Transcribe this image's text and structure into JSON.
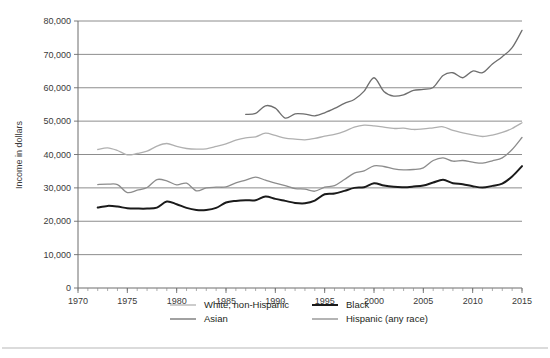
{
  "chart_data": {
    "type": "line",
    "title": "",
    "subtitle": "",
    "xlabel": "",
    "ylabel": "Income in dollars",
    "xlim": [
      1970,
      2015
    ],
    "ylim": [
      0,
      80000
    ],
    "grid": true,
    "legend_position": "bottom",
    "y_ticks": [
      0,
      10000,
      20000,
      30000,
      40000,
      50000,
      60000,
      70000,
      80000
    ],
    "y_tick_labels": [
      "0",
      "10,000",
      "20,000",
      "30,000",
      "40,000",
      "50,000",
      "60,000",
      "70,000",
      "80,000"
    ],
    "x_ticks": [
      1970,
      1975,
      1980,
      1985,
      1990,
      1995,
      2000,
      2005,
      2010,
      2015
    ],
    "x_tick_labels": [
      "1970",
      "1975",
      "1980",
      "1985",
      "1990",
      "1995",
      "2000",
      "2005",
      "2010",
      "2015"
    ],
    "x_minor_tick_step": 1,
    "series": [
      {
        "name": "White, non-Hispanic",
        "color": "#b0b0b0",
        "width": 1.3,
        "x": [
          1972,
          1973,
          1974,
          1975,
          1976,
          1977,
          1978,
          1979,
          1980,
          1981,
          1982,
          1983,
          1984,
          1985,
          1986,
          1987,
          1988,
          1989,
          1990,
          1991,
          1992,
          1993,
          1994,
          1995,
          1996,
          1997,
          1998,
          1999,
          2000,
          2001,
          2002,
          2003,
          2004,
          2005,
          2006,
          2007,
          2008,
          2009,
          2010,
          2011,
          2012,
          2013,
          2014,
          2015
        ],
        "values": [
          41500,
          42000,
          41200,
          39900,
          40300,
          41000,
          42500,
          43300,
          42400,
          41800,
          41600,
          41700,
          42400,
          43200,
          44300,
          45000,
          45300,
          46400,
          45700,
          44900,
          44600,
          44400,
          44800,
          45500,
          46000,
          46900,
          48200,
          48800,
          48600,
          48200,
          47800,
          47900,
          47500,
          47700,
          48000,
          48300,
          47200,
          46500,
          45900,
          45400,
          45800,
          46600,
          47800,
          49500
        ],
        "gap_values_note": "continuous 1972-2015"
      },
      {
        "name": "Asian",
        "color": "#6e6e6e",
        "width": 1.3,
        "x": [
          1987,
          1988,
          1989,
          1990,
          1991,
          1992,
          1993,
          1994,
          1995,
          1996,
          1997,
          1998,
          1999,
          2000,
          2001,
          2002,
          2003,
          2004,
          2005,
          2006,
          2007,
          2008,
          2009,
          2010,
          2011,
          2012,
          2013,
          2014,
          2015
        ],
        "values": [
          52000,
          52300,
          54600,
          53900,
          50900,
          52200,
          52100,
          51600,
          52500,
          53800,
          55300,
          56500,
          59000,
          63000,
          58900,
          57500,
          57900,
          59200,
          59500,
          60100,
          63700,
          64500,
          63000,
          65000,
          64500,
          67100,
          69300,
          72000,
          77200
        ]
      },
      {
        "name": "Black",
        "color": "#1a1a1a",
        "width": 2.0,
        "x": [
          1972,
          1973,
          1974,
          1975,
          1976,
          1977,
          1978,
          1979,
          1980,
          1981,
          1982,
          1983,
          1984,
          1985,
          1986,
          1987,
          1988,
          1989,
          1990,
          1991,
          1992,
          1993,
          1994,
          1995,
          1996,
          1997,
          1998,
          1999,
          2000,
          2001,
          2002,
          2003,
          2004,
          2005,
          2006,
          2007,
          2008,
          2009,
          2010,
          2011,
          2012,
          2013,
          2014,
          2015
        ],
        "values": [
          24100,
          24600,
          24400,
          23900,
          23800,
          23800,
          24100,
          25900,
          25100,
          24000,
          23400,
          23400,
          24000,
          25600,
          26100,
          26300,
          26300,
          27400,
          26700,
          26100,
          25500,
          25400,
          26200,
          28100,
          28300,
          29100,
          30000,
          30200,
          31400,
          30700,
          30300,
          30200,
          30400,
          30700,
          31600,
          32400,
          31400,
          31100,
          30500,
          30100,
          30600,
          31300,
          33400,
          36500
        ]
      },
      {
        "name": "Hispanic (any race)",
        "color": "#8c8c8c",
        "width": 1.3,
        "x": [
          1972,
          1973,
          1974,
          1975,
          1976,
          1977,
          1978,
          1979,
          1980,
          1981,
          1982,
          1983,
          1984,
          1985,
          1986,
          1987,
          1988,
          1989,
          1990,
          1991,
          1992,
          1993,
          1994,
          1995,
          1996,
          1997,
          1998,
          1999,
          2000,
          2001,
          2002,
          2003,
          2004,
          2005,
          2006,
          2007,
          2008,
          2009,
          2010,
          2011,
          2012,
          2013,
          2014,
          2015
        ],
        "values": [
          31000,
          31100,
          31000,
          28600,
          29300,
          30100,
          32500,
          32100,
          30900,
          31400,
          29100,
          30000,
          30200,
          30300,
          31500,
          32300,
          33200,
          32300,
          31400,
          30700,
          29800,
          29600,
          29000,
          30200,
          30700,
          32500,
          34400,
          35100,
          36600,
          36400,
          35700,
          35400,
          35500,
          36000,
          38200,
          39000,
          38000,
          38200,
          37700,
          37400,
          38100,
          39000,
          41500,
          45100
        ]
      }
    ]
  },
  "legend": {
    "entries": [
      {
        "label": "White, non-Hispanic",
        "color": "#b0b0b0",
        "swatch": "line-swatch"
      },
      {
        "label": "Black",
        "color": "#1a1a1a",
        "swatch": "line-swatch"
      },
      {
        "label": "Asian",
        "color": "#6e6e6e",
        "swatch": "line-swatch"
      },
      {
        "label": "Hispanic (any race)",
        "color": "#8c8c8c",
        "swatch": "line-swatch"
      }
    ]
  },
  "axes": {
    "y_title": "Income in dollars"
  }
}
